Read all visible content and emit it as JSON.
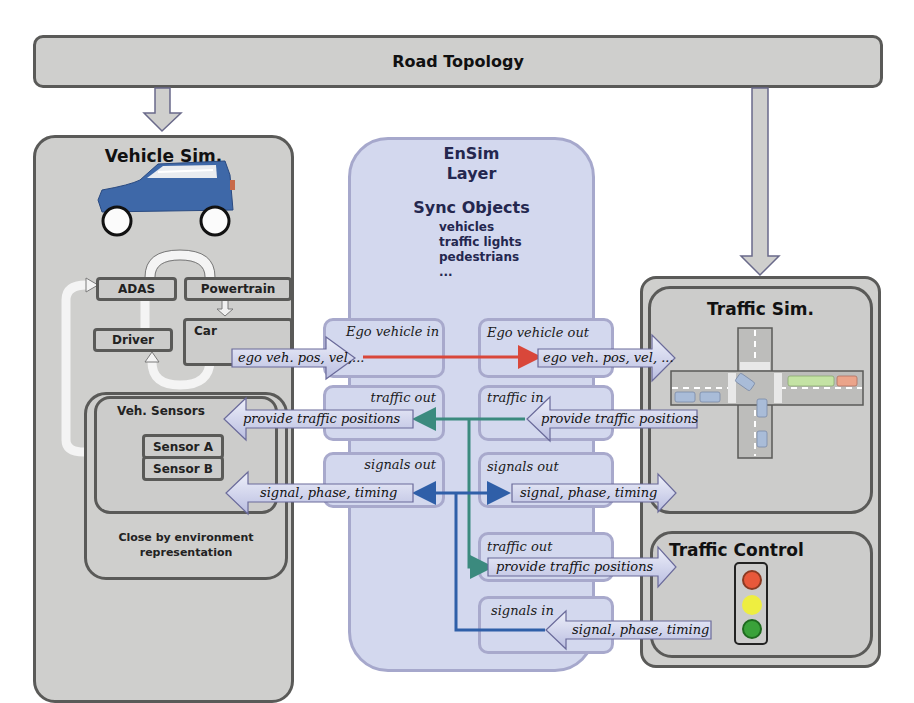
{
  "road_topology": {
    "label": "Road Topology"
  },
  "vehicle_sim": {
    "title": "Vehicle Sim.",
    "car_icon": "car-icon",
    "modules": {
      "adas": "ADAS",
      "powertrain": "Powertrain",
      "driver": "Driver",
      "car": "Car"
    },
    "sensors": {
      "title": "Veh. Sensors",
      "items": [
        "Sensor A",
        "Sensor B"
      ]
    },
    "environment_label": "Close by environment representation"
  },
  "ensim": {
    "title_line1": "EnSim",
    "title_line2": "Layer",
    "sync_title": "Sync Objects",
    "sync_items": [
      "vehicles",
      "traffic lights",
      "pedestrians",
      "..."
    ],
    "ports_left": [
      "Ego vehicle in",
      "traffic out",
      "signals out"
    ],
    "ports_right": [
      "Ego vehicle out",
      "traffic in",
      "signals out",
      "traffic out",
      "signals in"
    ]
  },
  "arrows": {
    "ego_in": "ego veh. pos, vel,...",
    "ego_out": "ego veh. pos, vel, ...",
    "traffic_to_vehicle": "provide traffic positions",
    "traffic_from_sim": "provide traffic positions",
    "signal_to_vehicle": "signal, phase, timing",
    "signal_to_traffic": "signal, phase, timing",
    "traffic_to_control": "provide traffic positions",
    "signal_from_control": "signal, phase, timing"
  },
  "traffic_sim": {
    "title": "Traffic Sim.",
    "icon": "intersection-icon"
  },
  "traffic_control": {
    "title": "Traffic Control",
    "icon": "traffic-light-icon"
  },
  "colors": {
    "ego_line": "#d9473a",
    "traffic_line": "#3b8a7e",
    "signal_line": "#2f5fa8",
    "ensim_fill": "#d3d8ee",
    "box_fill": "#cfcfcd",
    "car_blue": "#3e68a8"
  }
}
